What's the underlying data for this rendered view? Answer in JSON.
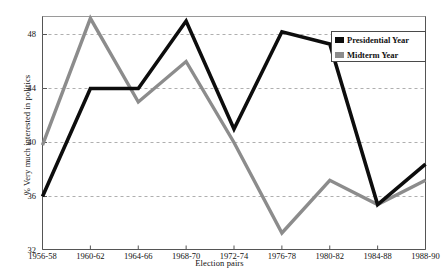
{
  "chart_data": {
    "type": "line",
    "title": "",
    "xlabel": "Election pairs",
    "ylabel": "% Very much interested in politics",
    "categories": [
      "1956-58",
      "1960-62",
      "1964-66",
      "1968-70",
      "1972-74",
      "1976-78",
      "1980-82",
      "1984-88",
      "1988-90"
    ],
    "xlim": [
      0,
      8
    ],
    "ylim": [
      32,
      50
    ],
    "yticks": [
      32,
      36,
      40,
      44,
      48
    ],
    "grid": "horizontal dashed gridlines at 36, 40, 44, 48",
    "legend_position": "top-right inside plot",
    "series": [
      {
        "name": "Presidential Year",
        "color": "#0d0d0d",
        "values": [
          36.0,
          44.0,
          44.0,
          49.0,
          41.0,
          48.2,
          47.3,
          35.4,
          38.4
        ]
      },
      {
        "name": "Midterm Year",
        "color": "#8c8c8c",
        "values": [
          39.8,
          49.2,
          43.0,
          46.0,
          40.0,
          33.3,
          37.2,
          35.4,
          37.2
        ]
      }
    ]
  },
  "axes": {
    "y_tick_labels": [
      "48",
      "44",
      "40",
      "36",
      "32"
    ],
    "x_tick_labels": [
      "1956-58",
      "1960-62",
      "1964-66",
      "1968-70",
      "1972-74",
      "1976-78",
      "1980-82",
      "1984-88",
      "1988-90"
    ],
    "y_title": "% Very much interested in politics",
    "x_title": "Election pairs"
  },
  "legend": {
    "items": [
      {
        "label": "Presidential Year",
        "color": "#0d0d0d"
      },
      {
        "label": "Midterm Year",
        "color": "#8c8c8c"
      }
    ]
  }
}
